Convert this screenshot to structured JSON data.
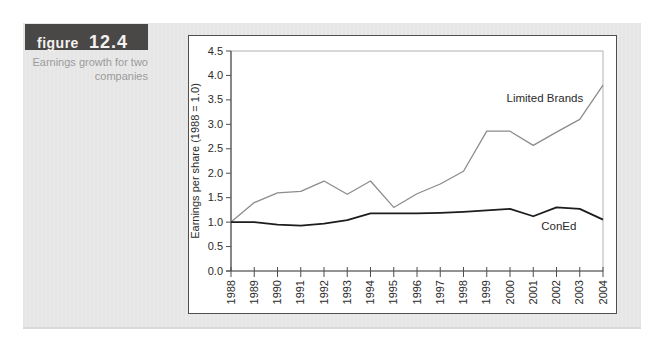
{
  "figure_tag": {
    "label": "figure",
    "number": "12.4",
    "bg": "#4a4847",
    "text_color": "#f4f2f0"
  },
  "caption": {
    "line1": "Earnings growth for two",
    "line2": "companies",
    "color": "#9b9b9b"
  },
  "chart_data": {
    "type": "line",
    "title": "",
    "xlabel": "",
    "ylabel": "Earnings per share (1988 = 1.0)",
    "ylim": [
      0.0,
      4.5
    ],
    "ytick_step": 0.5,
    "ytick_labels": [
      "0.0",
      "0.5",
      "1.0",
      "1.5",
      "2.0",
      "2.5",
      "3.0",
      "3.5",
      "4.0",
      "4.5"
    ],
    "x": [
      1988,
      1989,
      1990,
      1991,
      1992,
      1993,
      1994,
      1995,
      1996,
      1997,
      1998,
      1999,
      2000,
      2001,
      2002,
      2003,
      2004
    ],
    "xtick_labels": [
      "1988",
      "1989",
      "1990",
      "1991",
      "1992",
      "1993",
      "1994",
      "1995",
      "1996",
      "1997",
      "1998",
      "1999",
      "2000",
      "2001",
      "2002",
      "2003",
      "2004"
    ],
    "xtick_label_rotation": -90,
    "grid": false,
    "legend_position": "inline-annotations",
    "series": [
      {
        "name": "Limited Brands",
        "color": "#8c8c8c",
        "stroke_width": 1.3,
        "values": [
          1.0,
          1.4,
          1.6,
          1.63,
          1.84,
          1.57,
          1.84,
          1.3,
          1.58,
          1.78,
          2.04,
          2.86,
          2.86,
          2.57,
          2.84,
          3.1,
          3.8
        ],
        "label_anchor": {
          "year": 2001.5,
          "value": 3.45
        }
      },
      {
        "name": "ConEd",
        "color": "#1d1d1d",
        "stroke_width": 1.8,
        "values": [
          1.0,
          1.0,
          0.95,
          0.93,
          0.97,
          1.04,
          1.18,
          1.18,
          1.18,
          1.19,
          1.21,
          1.24,
          1.27,
          1.12,
          1.3,
          1.27,
          1.05
        ],
        "label_anchor": {
          "year": 2002.1,
          "value": 0.83
        }
      }
    ],
    "axis_color": "#4f4f4f",
    "plot_border_color": "#b3b3b3",
    "tick_label_color": "#2b2b2b",
    "series_label_color": "#2b2b2b"
  }
}
